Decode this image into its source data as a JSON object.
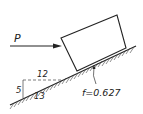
{
  "diagram": {
    "type": "inclined-plane-block",
    "force_label": "P",
    "slope": {
      "horizontal": "12",
      "vertical": "5",
      "hypotenuse": "13"
    },
    "friction_label": "f=0.627",
    "colors": {
      "line": "#222222",
      "background": "#ffffff"
    }
  }
}
